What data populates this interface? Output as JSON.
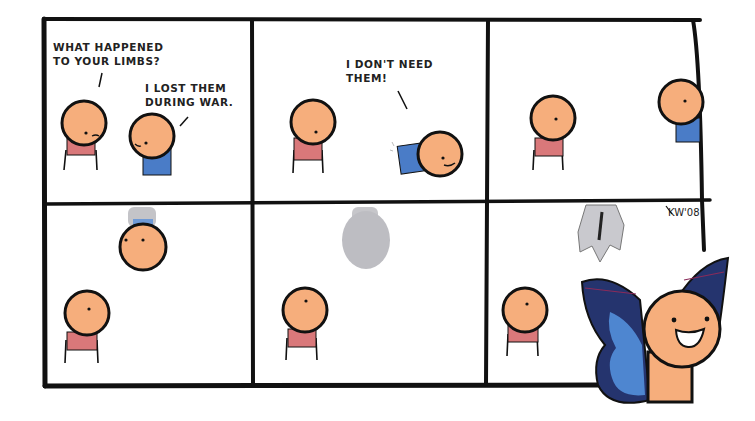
{
  "comic": {
    "panels": [
      {
        "id": 1,
        "dialogue": [
          {
            "speaker": "pink-shirt",
            "lines": [
              "WHAT HAPPENED",
              "TO YOUR LIMBS?"
            ]
          },
          {
            "speaker": "blue-shirt",
            "lines": [
              "I LOST THEM",
              "DURING WAR."
            ]
          }
        ]
      },
      {
        "id": 2,
        "dialogue": [
          {
            "speaker": "blue-shirt",
            "lines": [
              "I DON'T NEED",
              "THEM!"
            ]
          }
        ]
      },
      {
        "id": 3,
        "dialogue": []
      },
      {
        "id": 4,
        "dialogue": []
      },
      {
        "id": 5,
        "dialogue": []
      },
      {
        "id": 6,
        "dialogue": [],
        "signature": "KW'08"
      }
    ],
    "colors": {
      "skin": "#F6AE7C",
      "pink_shirt": "#D9787A",
      "blue_shirt": "#4A7CC7",
      "cocoon": "#BDBDC2",
      "wing_dark": "#25346E",
      "wing_light": "#4E86D0",
      "outline": "#111111"
    }
  }
}
